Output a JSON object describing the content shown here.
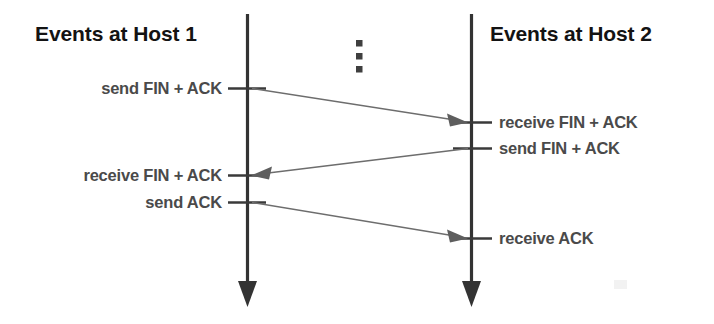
{
  "diagram": {
    "kind": "sequence-diagram",
    "background_color": "#ffffff",
    "title_color": "#131313",
    "label_color": "#4a4a4a",
    "lifeline_color": "#333333",
    "message_color": "#6d6d6d",
    "headers": {
      "left": "Events at Host 1",
      "right": "Events at Host 2"
    },
    "continuation": {
      "symbol": "vertical-ellipsis",
      "dots": 3
    },
    "left_events": [
      {
        "label": "send FIN + ACK"
      },
      {
        "label": "receive FIN + ACK"
      },
      {
        "label": "send ACK"
      }
    ],
    "right_events": [
      {
        "label": "receive FIN + ACK"
      },
      {
        "label": "send FIN + ACK"
      },
      {
        "label": "receive ACK"
      }
    ],
    "messages": [
      {
        "name": "fin-ack-host1-to-host2",
        "direction": "left-to-right"
      },
      {
        "name": "fin-ack-host2-to-host1",
        "direction": "right-to-left"
      },
      {
        "name": "ack-host1-to-host2",
        "direction": "left-to-right"
      }
    ]
  }
}
